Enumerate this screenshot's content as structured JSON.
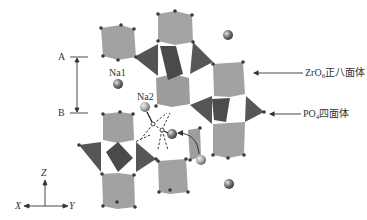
{
  "diagram": {
    "type": "crystal-structure",
    "labels": {
      "a_marker": "A",
      "b_marker": "B",
      "na1": "Na1",
      "na2": "Na2",
      "zro6_prefix": "ZrO",
      "zro6_sub": "6",
      "zro6_suffix": "正八面体",
      "po4_prefix": "PO",
      "po4_sub": "4",
      "po4_suffix": "四面体",
      "axis_z": "Z",
      "axis_x": "X",
      "axis_y": "Y"
    },
    "colors": {
      "octahedron_fill": "#9a9a9a",
      "tetrahedron_fill": "#505050",
      "vertex": "#3a3a3a",
      "na_sphere": "#6e6e6e",
      "line": "#333333",
      "background": "#ffffff"
    },
    "legend": [
      {
        "name": "ZrO6 octahedron",
        "text": "ZrO6正八面体"
      },
      {
        "name": "PO4 tetrahedron",
        "text": "PO4四面体"
      }
    ]
  }
}
